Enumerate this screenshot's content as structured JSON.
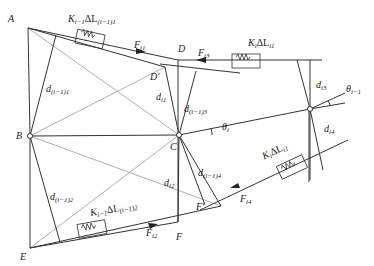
{
  "diagram": {
    "type": "cable-spring mechanism force diagram",
    "points": {
      "A": {
        "label": "A",
        "x": 28,
        "y": 28
      },
      "B": {
        "label": "B",
        "x": 30,
        "y": 136
      },
      "C": {
        "label": "C",
        "x": 179,
        "y": 135
      },
      "D": {
        "label": "D",
        "x": 178,
        "y": 60
      },
      "D_prime": {
        "label": "D′",
        "x": 165,
        "y": 67
      },
      "E": {
        "label": "E",
        "x": 30,
        "y": 248
      },
      "F": {
        "label": "F",
        "x": 178,
        "y": 222
      },
      "F_prime": {
        "label": "F′",
        "x": 221,
        "y": 206
      },
      "node_right": {
        "x": 310,
        "y": 109
      }
    },
    "labels": {
      "A": "A",
      "B": "B",
      "C": "C",
      "D": "D",
      "D_prime": "D′",
      "E": "E",
      "F": "F",
      "F_prime": "F′",
      "spring_top_left": {
        "main": "K",
        "sub1": "i−1",
        "mid": "ΔL",
        "sub2": "(i−1)1"
      },
      "spring_top_right": {
        "main": "K",
        "sub1": "i",
        "mid": "ΔL",
        "sub2": "i1"
      },
      "spring_bottom_left": {
        "main": "K",
        "sub1": "i−1",
        "mid": "ΔL",
        "sub2": "(i−1)2"
      },
      "spring_bottom_right": {
        "main": "K",
        "sub1": "i",
        "mid": "ΔL",
        "sub2": "i1"
      },
      "F_i1": {
        "main": "F",
        "sub": "i1"
      },
      "F_i2": {
        "main": "F",
        "sub": "i2"
      },
      "F_i3": {
        "main": "F",
        "sub": "i3"
      },
      "F_i4": {
        "main": "F",
        "sub": "i4"
      },
      "d_prev1": {
        "main": "d",
        "sub": "(i−1)1"
      },
      "d_prev2": {
        "main": "d",
        "sub": "(i−1)2"
      },
      "d_prev3": {
        "main": "d",
        "sub": "(i−1)3"
      },
      "d_prev4": {
        "main": "d",
        "sub": "(i−1)4"
      },
      "d_i1": {
        "main": "d",
        "sub": "i1"
      },
      "d_i2": {
        "main": "d",
        "sub": "i2"
      },
      "d_i3": {
        "main": "d",
        "sub": "i3"
      },
      "d_i4": {
        "main": "d",
        "sub": "i4"
      },
      "theta_i": {
        "main": "θ",
        "sub": "i"
      },
      "theta_prev": {
        "main": "θ",
        "sub": "i−1"
      }
    },
    "colors": {
      "line": "#333333",
      "light_line": "#9a9a9a",
      "background": "#ffffff"
    }
  }
}
